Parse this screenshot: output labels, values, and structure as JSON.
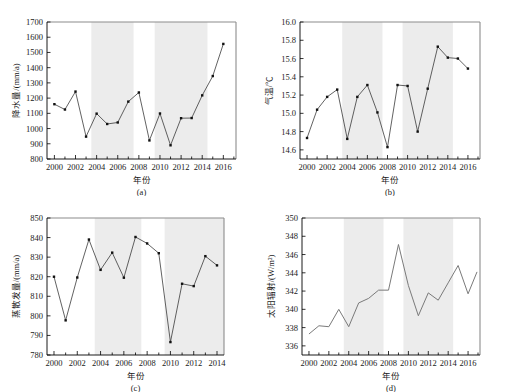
{
  "figure": {
    "background": "#ffffff",
    "band_color": "#ececec",
    "line_color": "#3a3a3a",
    "marker_color": "#111111"
  },
  "panels": [
    {
      "id": "a",
      "caption": "(a)",
      "xlabel": "年份",
      "ylabel": "降水量/(mm/a)",
      "xticks": [
        2000,
        2002,
        2004,
        2006,
        2008,
        2010,
        2012,
        2014,
        2016
      ],
      "yticks": [
        800,
        900,
        1000,
        1100,
        1200,
        1300,
        1400,
        1500,
        1600,
        1700
      ],
      "xlim": [
        1999.3,
        2017.2
      ],
      "ylim": [
        800,
        1700
      ],
      "bands": [
        [
          2003.5,
          2007.5
        ],
        [
          2009.5,
          2014.5
        ]
      ],
      "markers": true
    },
    {
      "id": "b",
      "caption": "(b)",
      "xlabel": "年份",
      "ylabel": "气温/℃",
      "xticks": [
        2000,
        2002,
        2004,
        2006,
        2008,
        2010,
        2012,
        2014,
        2016
      ],
      "yticks": [
        14.6,
        14.8,
        15.0,
        15.2,
        15.4,
        15.6,
        15.8,
        16.0
      ],
      "xlim": [
        1999.3,
        2017.2
      ],
      "ylim": [
        14.5,
        16.0
      ],
      "bands": [
        [
          2003.5,
          2007.5
        ],
        [
          2009.5,
          2014.5
        ]
      ],
      "markers": true
    },
    {
      "id": "c",
      "caption": "(c)",
      "xlabel": "年份",
      "ylabel": "蒸散发量/(mm/a)",
      "xticks": [
        2000,
        2002,
        2004,
        2006,
        2008,
        2010,
        2012,
        2014
      ],
      "yticks": [
        780,
        790,
        800,
        810,
        820,
        830,
        840,
        850
      ],
      "xlim": [
        1999.4,
        2014.6
      ],
      "ylim": [
        780,
        850
      ],
      "bands": [
        [
          2003.5,
          2007.5
        ],
        [
          2009.5,
          2014.6
        ]
      ],
      "markers": true
    },
    {
      "id": "d",
      "caption": "(d)",
      "xlabel": "年份",
      "ylabel": "太阳辐射/(W/m²)",
      "xticks": [
        2000,
        2002,
        2004,
        2006,
        2008,
        2010,
        2012,
        2014,
        2016
      ],
      "yticks": [
        336,
        338,
        340,
        342,
        344,
        346,
        348,
        350
      ],
      "xlim": [
        1999.3,
        2017.2
      ],
      "ylim": [
        335,
        350
      ],
      "bands": [
        [
          2003.5,
          2007.5
        ],
        [
          2009.5,
          2014.5
        ]
      ],
      "markers": false
    }
  ],
  "chart_data": [
    {
      "type": "line",
      "panel": "a",
      "title": "",
      "xlabel": "年份",
      "ylabel": "降水量/(mm/a)",
      "xlim": [
        1999.3,
        2017.2
      ],
      "ylim": [
        800,
        1700
      ],
      "grid": false,
      "legend": null,
      "x": [
        2000,
        2001,
        2002,
        2003,
        2004,
        2005,
        2006,
        2007,
        2008,
        2009,
        2010,
        2011,
        2012,
        2013,
        2014,
        2015,
        2016
      ],
      "values": [
        1160,
        1125,
        1243,
        947,
        1098,
        1030,
        1040,
        1177,
        1237,
        922,
        1099,
        890,
        1068,
        1069,
        1218,
        1345,
        1556
      ],
      "annotations": [
        "shaded bands mark 2003.5-2007.5 and 2009.5-2014.5"
      ]
    },
    {
      "type": "line",
      "panel": "b",
      "title": "",
      "xlabel": "年份",
      "ylabel": "气温/℃",
      "xlim": [
        1999.3,
        2017.2
      ],
      "ylim": [
        14.5,
        16.0
      ],
      "grid": false,
      "legend": null,
      "x": [
        2000,
        2001,
        2002,
        2003,
        2004,
        2005,
        2006,
        2007,
        2008,
        2009,
        2010,
        2011,
        2012,
        2013,
        2014,
        2015,
        2016
      ],
      "values": [
        14.73,
        15.04,
        15.18,
        15.26,
        14.72,
        15.18,
        15.31,
        15.01,
        14.63,
        15.31,
        15.3,
        14.8,
        15.27,
        15.73,
        15.61,
        15.6,
        15.49
      ],
      "annotations": [
        "shaded bands mark 2003.5-2007.5 and 2009.5-2014.5"
      ]
    },
    {
      "type": "line",
      "panel": "c",
      "title": "",
      "xlabel": "年份",
      "ylabel": "蒸散发量/(mm/a)",
      "xlim": [
        1999.4,
        2014.6
      ],
      "ylim": [
        780,
        850
      ],
      "grid": false,
      "legend": null,
      "x": [
        2000,
        2001,
        2002,
        2003,
        2004,
        2005,
        2006,
        2007,
        2008,
        2009,
        2010,
        2011,
        2012,
        2013,
        2014
      ],
      "values": [
        820.0,
        797.7,
        819.6,
        839.0,
        823.5,
        832.3,
        819.5,
        840.3,
        837.0,
        832.0,
        786.6,
        816.4,
        815.2,
        830.5,
        825.8
      ],
      "annotations": [
        "shaded bands mark 2003.5-2007.5 and 2009.5-2014.6"
      ]
    },
    {
      "type": "line",
      "panel": "d",
      "title": "",
      "xlabel": "年份",
      "ylabel": "太阳辐射/(W/m²)",
      "xlim": [
        1999.3,
        2017.2
      ],
      "ylim": [
        335,
        350
      ],
      "grid": false,
      "legend": null,
      "x": [
        2000,
        2001,
        2002,
        2003,
        2004,
        2005,
        2006,
        2007,
        2008,
        2009,
        2010,
        2011,
        2012,
        2013,
        2014,
        2015,
        2016
      ],
      "values": [
        337.3,
        338.2,
        338.1,
        340.0,
        338.1,
        340.7,
        341.2,
        342.1,
        342.1,
        347.1,
        342.6,
        339.3,
        341.8,
        341.0,
        342.9,
        344.8,
        341.7
      ],
      "series_extra": {
        "last_x": 2016.9,
        "last_y": 344.1
      },
      "annotations": [
        "shaded bands mark 2003.5-2007.5 and 2009.5-2014.5",
        "line drawn without point markers"
      ]
    }
  ]
}
